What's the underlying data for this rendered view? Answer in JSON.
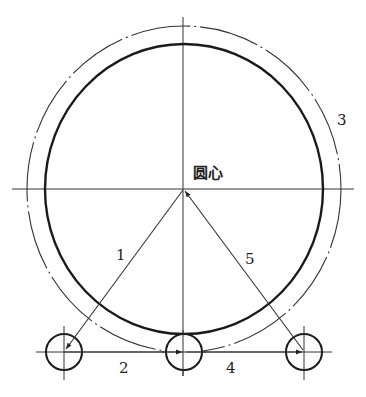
{
  "diagram": {
    "center_label": "圆心",
    "labels": {
      "path1": "1",
      "path2": "2",
      "outer_circle": "3",
      "path4": "4",
      "path5": "5"
    },
    "colors": {
      "stroke": "#222222",
      "background": "#ffffff"
    },
    "geometry": {
      "center": [
        184,
        189
      ],
      "inner_circle": {
        "rx": 139,
        "ry": 145,
        "style": "thick-solid"
      },
      "outer_circle": {
        "rx": 157,
        "ry": 163,
        "style": "thin-dash-dot"
      },
      "small_circles": [
        {
          "cx": 64,
          "cy": 352,
          "r": 18
        },
        {
          "cx": 184,
          "cy": 352,
          "r": 18
        },
        {
          "cx": 304,
          "cy": 352,
          "r": 18
        }
      ]
    }
  }
}
